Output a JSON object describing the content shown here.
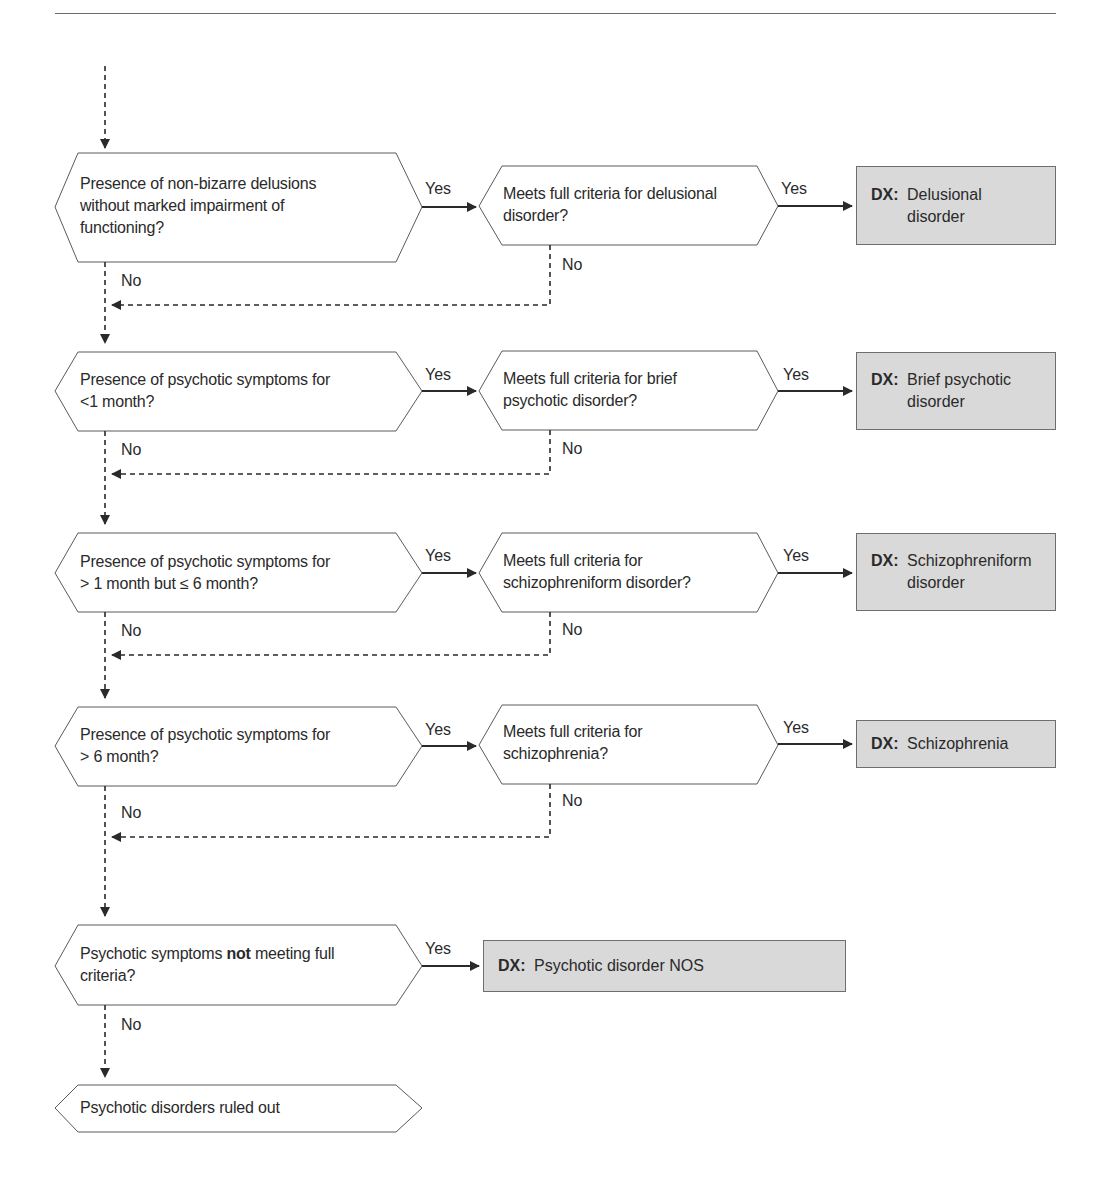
{
  "diagram": {
    "title": "",
    "edge_labels": {
      "yes": "Yes",
      "no": "No"
    },
    "dx_prefix": "DX:",
    "rows": [
      {
        "question": "Presence of non-bizarre delusions without marked impairment of functioning?",
        "question_lines": [
          "Presence of non-bizarre delusions",
          "without marked impairment of",
          "functioning?"
        ],
        "criteria": "Meets full criteria for delusional disorder?",
        "criteria_lines": [
          "Meets full criteria for delusional",
          "disorder?"
        ],
        "diagnosis": "Delusional disorder",
        "diagnosis_lines": "Delusional\ndisorder"
      },
      {
        "question": "Presence of psychotic symptoms for <1 month?",
        "question_lines": [
          "Presence of psychotic symptoms for",
          "<1 month?"
        ],
        "criteria": "Meets full criteria for brief psychotic disorder?",
        "criteria_lines": [
          "Meets full criteria for brief",
          "psychotic disorder?"
        ],
        "diagnosis": "Brief psychotic disorder",
        "diagnosis_lines": "Brief psychotic\ndisorder"
      },
      {
        "question": "Presence of psychotic symptoms for > 1 month but ≤ 6 month?",
        "question_lines": [
          "Presence of psychotic symptoms for",
          "> 1 month but ≤ 6 month?"
        ],
        "criteria": "Meets full criteria for schizophreniform disorder?",
        "criteria_lines": [
          "Meets full criteria for",
          "schizophreniform disorder?"
        ],
        "diagnosis": "Schizophreniform disorder",
        "diagnosis_lines": "Schizophreniform\ndisorder"
      },
      {
        "question": "Presence of psychotic symptoms for > 6 month?",
        "question_lines": [
          "Presence of psychotic symptoms for",
          "> 6 month?"
        ],
        "criteria": "Meets full criteria for schizophrenia?",
        "criteria_lines": [
          "Meets full criteria for",
          "schizophrenia?"
        ],
        "diagnosis": "Schizophrenia",
        "diagnosis_lines": "Schizophrenia"
      }
    ],
    "nos_row": {
      "question_pre": "Psychotic symptoms ",
      "question_bold": "not",
      "question_post": " meeting full",
      "question_line2": "criteria?",
      "diagnosis": "Psychotic disorder NOS"
    },
    "terminal": {
      "text": "Psychotic disorders ruled out"
    },
    "colors": {
      "line": "#2a2a2a",
      "shape_stroke": "#5a5a5a",
      "dx_fill": "#d9d9d9",
      "rule": "#6a6a6a"
    }
  }
}
